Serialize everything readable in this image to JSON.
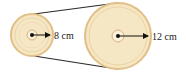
{
  "diagram": {
    "small_pulley": {
      "cx": 32,
      "cy": 35,
      "r": 21,
      "radius_label": "8 cm"
    },
    "large_pulley": {
      "cx": 118,
      "cy": 36,
      "r": 33,
      "radius_label": "12 cm"
    },
    "colors": {
      "pulley_fill": "#f5e6c4",
      "pulley_rim": "#e2bf86",
      "pulley_ring": "#ecd3a3",
      "belt": "#2a2a2a",
      "arrow": "#111111"
    }
  }
}
